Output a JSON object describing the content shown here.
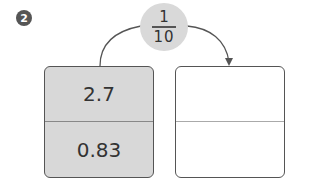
{
  "step_badge": "2",
  "operator": {
    "numerator": "1",
    "denominator": "10"
  },
  "left_box": {
    "top_value": "2.7",
    "bottom_value": "0.83"
  },
  "right_box": {
    "top_value": "",
    "bottom_value": ""
  },
  "colors": {
    "box_fill": "#d8d8d8",
    "circle_fill": "#d9d9d9",
    "stroke": "#555555"
  }
}
